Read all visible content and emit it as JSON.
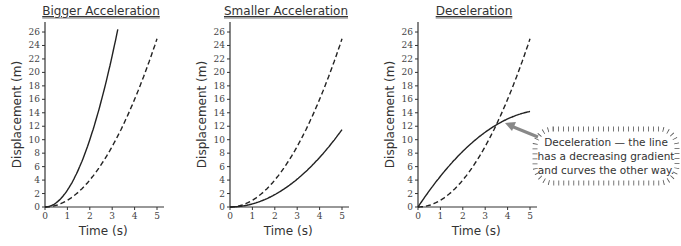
{
  "chart_data": [
    {
      "type": "line",
      "title": "Bigger Acceleration",
      "xlabel": "Time (s)",
      "ylabel": "Displacement (m)",
      "xlim": [
        0,
        5
      ],
      "ylim": [
        0,
        26
      ],
      "xticks": [
        0,
        1,
        2,
        3,
        4,
        5
      ],
      "yticks": [
        0,
        2,
        4,
        6,
        8,
        10,
        12,
        14,
        16,
        18,
        20,
        22,
        24,
        26
      ],
      "grid": false,
      "series": [
        {
          "name": "reference (dashed)",
          "style": "dashed",
          "x": [
            0,
            1,
            2,
            3,
            4,
            5
          ],
          "values": [
            0,
            1,
            4,
            9,
            16,
            25
          ]
        },
        {
          "name": "bigger acceleration (solid)",
          "style": "solid",
          "x": [
            0,
            1,
            2,
            3,
            3.26
          ],
          "values": [
            0,
            2.5,
            10,
            22.5,
            26.6
          ]
        }
      ]
    },
    {
      "type": "line",
      "title": "Smaller Acceleration",
      "xlabel": "Time (s)",
      "ylabel": "Displacement (m)",
      "xlim": [
        0,
        5
      ],
      "ylim": [
        0,
        26
      ],
      "xticks": [
        0,
        1,
        2,
        3,
        4,
        5
      ],
      "yticks": [
        0,
        2,
        4,
        6,
        8,
        10,
        12,
        14,
        16,
        18,
        20,
        22,
        24,
        26
      ],
      "grid": false,
      "series": [
        {
          "name": "reference (dashed)",
          "style": "dashed",
          "x": [
            0,
            1,
            2,
            3,
            4,
            5
          ],
          "values": [
            0,
            1,
            4,
            9,
            16,
            25
          ]
        },
        {
          "name": "smaller acceleration (solid)",
          "style": "solid",
          "x": [
            0,
            1,
            2,
            3,
            4,
            5
          ],
          "values": [
            0,
            0.46,
            1.84,
            4.14,
            7.36,
            11.5
          ]
        }
      ]
    },
    {
      "type": "line",
      "title": "Deceleration",
      "xlabel": "Time (s)",
      "ylabel": "Displacement (m)",
      "xlim": [
        0,
        5
      ],
      "ylim": [
        0,
        26
      ],
      "xticks": [
        0,
        1,
        2,
        3,
        4,
        5
      ],
      "yticks": [
        0,
        2,
        4,
        6,
        8,
        10,
        12,
        14,
        16,
        18,
        20,
        22,
        24,
        26
      ],
      "grid": false,
      "series": [
        {
          "name": "reference (dashed)",
          "style": "dashed",
          "x": [
            0,
            1,
            2,
            3,
            4,
            5
          ],
          "values": [
            0,
            1,
            4,
            9,
            16,
            25
          ]
        },
        {
          "name": "deceleration (solid)",
          "style": "solid",
          "x": [
            0,
            1,
            2,
            3,
            4,
            5
          ],
          "values": [
            0,
            4.57,
            8.27,
            11.11,
            13.09,
            14.2
          ]
        }
      ],
      "annotations": [
        {
          "text_lines": [
            "Deceleration — the line",
            "has a decreasing gradient",
            "and curves the other way."
          ],
          "points_to": {
            "x": 3.8,
            "y": 12.8
          }
        }
      ]
    }
  ],
  "labels": {
    "titles": [
      "Bigger Acceleration",
      "Smaller Acceleration",
      "Deceleration"
    ],
    "xlabel": "Time (s)",
    "ylabel": "Displacement (m)",
    "callout": [
      "Deceleration — the line",
      "has a decreasing gradient",
      "and curves the other way."
    ]
  },
  "colors": {
    "line": "#222222",
    "axis": "#333333",
    "arrow": "#888888",
    "text": "#333333"
  }
}
